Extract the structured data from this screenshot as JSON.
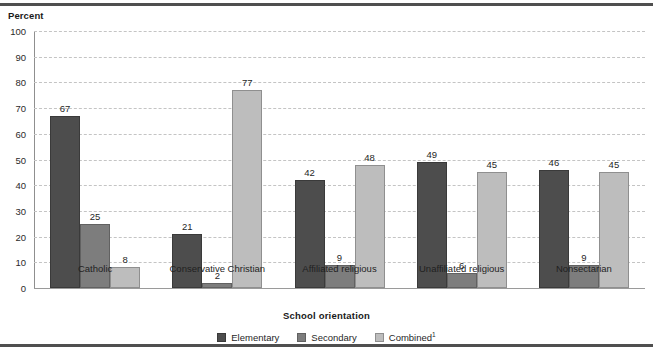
{
  "chart_data": {
    "type": "bar",
    "title": "",
    "xlabel": "School orientation",
    "ylabel": "Percent",
    "ylim": [
      0,
      100
    ],
    "ytick_step": 10,
    "yticks": [
      100,
      90,
      80,
      70,
      60,
      50,
      40,
      30,
      20,
      10,
      0
    ],
    "grid": true,
    "legend_position": "bottom",
    "categories": [
      "Catholic",
      "Conservative Christian",
      "Affiliated religious",
      "Unaffiliated religious",
      "Nonsectarian"
    ],
    "series": [
      {
        "name": "Elementary",
        "color": "#4d4d4d",
        "values": [
          67,
          21,
          42,
          49,
          46
        ]
      },
      {
        "name": "Secondary",
        "color": "#7d7d7d",
        "values": [
          25,
          2,
          9,
          6,
          9
        ]
      },
      {
        "name": "Combined",
        "name_sup": "1",
        "color": "#bdbdbd",
        "values": [
          8,
          77,
          48,
          45,
          45
        ]
      }
    ]
  },
  "legend": [
    {
      "label": "Elementary",
      "sup": "",
      "series": 0
    },
    {
      "label": "Secondary",
      "sup": "",
      "series": 1
    },
    {
      "label": "Combined",
      "sup": "1",
      "series": 2
    }
  ],
  "colors": {
    "elementary": "#4d4d4d",
    "secondary": "#7d7d7d",
    "combined": "#bdbdbd",
    "rule": "#4f4f4f",
    "gridline": "#c4c4c4",
    "axis": "#8f8f8f",
    "text": "#1f1f1f",
    "background": "#ffffff"
  }
}
